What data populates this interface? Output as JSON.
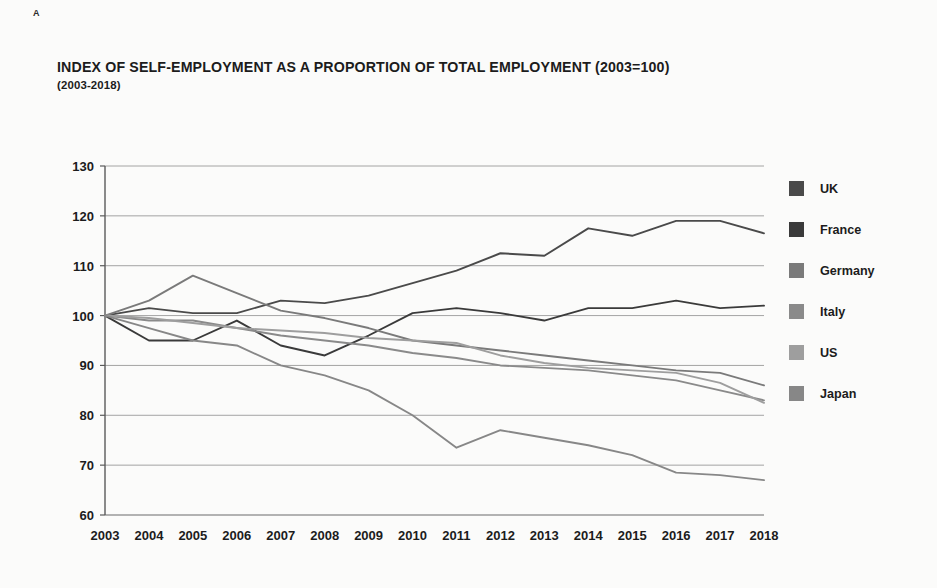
{
  "corner_label": "A",
  "chart_data": {
    "type": "line",
    "title": "INDEX OF SELF-EMPLOYMENT AS A PROPORTION OF TOTAL EMPLOYMENT (2003=100)",
    "subtitle": "(2003-2018)",
    "xlabel": "",
    "ylabel": "",
    "xlim": [
      2003,
      2018
    ],
    "ylim": [
      60,
      130
    ],
    "grid": true,
    "legend_position": "right",
    "categories": [
      2003,
      2004,
      2005,
      2006,
      2007,
      2008,
      2009,
      2010,
      2011,
      2012,
      2013,
      2014,
      2015,
      2016,
      2017,
      2018
    ],
    "x_tick_labels": [
      "2003",
      "2004",
      "2005",
      "2006",
      "2007",
      "2008",
      "2009",
      "2010",
      "2011",
      "2012",
      "2013",
      "2014",
      "2015",
      "2016",
      "2017",
      "2018"
    ],
    "y_tick_labels": [
      "60",
      "70",
      "80",
      "90",
      "100",
      "110",
      "120",
      "130"
    ],
    "y_ticks": [
      60,
      70,
      80,
      90,
      100,
      110,
      120,
      130
    ],
    "series": [
      {
        "name": "UK",
        "color": "#4a4a4a",
        "values": [
          100,
          101.5,
          100.5,
          100.5,
          103,
          102.5,
          104,
          106.5,
          109,
          112.5,
          112,
          117.5,
          116,
          119,
          119,
          116.5
        ]
      },
      {
        "name": "France",
        "color": "#3a3a3a",
        "values": [
          100,
          95,
          95,
          99,
          94,
          92,
          96,
          100.5,
          101.5,
          100.5,
          99,
          101.5,
          101.5,
          103,
          101.5,
          102
        ]
      },
      {
        "name": "Germany",
        "color": "#7a7a7a",
        "values": [
          100,
          103,
          108,
          104.5,
          101,
          99.5,
          97.5,
          95,
          94,
          93,
          92,
          91,
          90,
          89,
          88.5,
          86
        ]
      },
      {
        "name": "Italy",
        "color": "#8a8a8a",
        "values": [
          100,
          99,
          99,
          97.5,
          96,
          95,
          94,
          92.5,
          91.5,
          90,
          89.5,
          89,
          88,
          87,
          85,
          83
        ]
      },
      {
        "name": "US",
        "color": "#9e9e9e",
        "values": [
          100,
          99.5,
          98.5,
          97.5,
          97,
          96.5,
          95.5,
          95,
          94.5,
          92,
          90.5,
          89.5,
          89,
          88.5,
          86.5,
          82.5
        ]
      },
      {
        "name": "Japan",
        "color": "#878787",
        "values": [
          100,
          97.5,
          95,
          94,
          90,
          88,
          85,
          80,
          73.5,
          77,
          75.5,
          74,
          72,
          68.5,
          68,
          67
        ]
      }
    ]
  },
  "legend": {
    "items": [
      {
        "label": "UK",
        "color": "#4a4a4a"
      },
      {
        "label": "France",
        "color": "#3a3a3a"
      },
      {
        "label": "Germany",
        "color": "#7a7a7a"
      },
      {
        "label": "Italy",
        "color": "#8a8a8a"
      },
      {
        "label": "US",
        "color": "#9e9e9e"
      },
      {
        "label": "Japan",
        "color": "#878787"
      }
    ]
  }
}
